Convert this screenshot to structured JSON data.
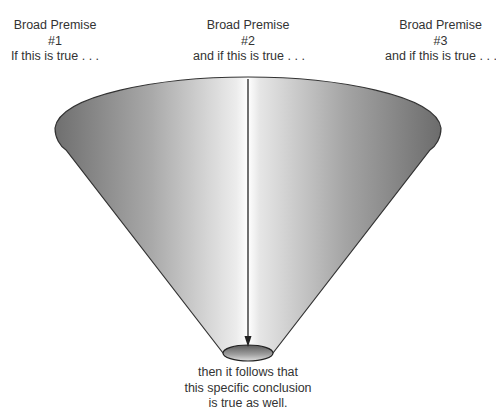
{
  "premises": [
    {
      "title": "Broad Premise",
      "number": "#1",
      "condition": "If this is true . . ."
    },
    {
      "title": "Broad Premise",
      "number": "#2",
      "condition": "and if this is true . . ."
    },
    {
      "title": "Broad Premise",
      "number": "#3",
      "condition": "and if this is true . . ."
    }
  ],
  "conclusion": {
    "lines": [
      "then it follows that",
      "this specific conclusion",
      "is true as well."
    ]
  },
  "colors": {
    "cone_edge": "#8a8a8a",
    "cone_highlight": "#f2f2f2",
    "outline": "#333333",
    "arrow": "#222222",
    "text": "#333333"
  }
}
